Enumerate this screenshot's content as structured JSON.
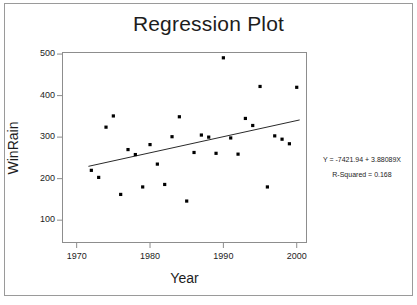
{
  "chart_data": {
    "type": "scatter",
    "title": "Regression Plot",
    "xlabel": "Year",
    "ylabel": "WinRain",
    "xlim": [
      1968.0,
      2001.4
    ],
    "ylim": [
      45,
      505
    ],
    "xticks": [
      1970,
      1980,
      1990,
      2000
    ],
    "yticks": [
      100,
      200,
      300,
      400,
      500
    ],
    "grid": false,
    "legend": null,
    "marker": "filled-square",
    "marker_color": "#000000",
    "line_color": "#2a2a2a",
    "points": [
      {
        "x": 1972,
        "y": 220
      },
      {
        "x": 1973,
        "y": 203
      },
      {
        "x": 1974,
        "y": 324
      },
      {
        "x": 1975,
        "y": 351
      },
      {
        "x": 1976,
        "y": 162
      },
      {
        "x": 1977,
        "y": 270
      },
      {
        "x": 1978,
        "y": 258
      },
      {
        "x": 1979,
        "y": 180
      },
      {
        "x": 1980,
        "y": 282
      },
      {
        "x": 1981,
        "y": 235
      },
      {
        "x": 1982,
        "y": 186
      },
      {
        "x": 1983,
        "y": 301
      },
      {
        "x": 1984,
        "y": 349
      },
      {
        "x": 1985,
        "y": 146
      },
      {
        "x": 1986,
        "y": 263
      },
      {
        "x": 1987,
        "y": 305
      },
      {
        "x": 1988,
        "y": 300
      },
      {
        "x": 1989,
        "y": 261
      },
      {
        "x": 1990,
        "y": 491
      },
      {
        "x": 1991,
        "y": 298
      },
      {
        "x": 1992,
        "y": 259
      },
      {
        "x": 1993,
        "y": 345
      },
      {
        "x": 1994,
        "y": 328
      },
      {
        "x": 1995,
        "y": 422
      },
      {
        "x": 1996,
        "y": 180
      },
      {
        "x": 1997,
        "y": 303
      },
      {
        "x": 1998,
        "y": 295
      },
      {
        "x": 1999,
        "y": 284
      },
      {
        "x": 2000,
        "y": 420
      }
    ],
    "fit_line": {
      "equation": "Y = -7421.94 + 3.88089X",
      "intercept": -7421.94,
      "slope": 3.88089,
      "r_squared": 0.168,
      "x_start": 1971.6,
      "x_end": 2000.4
    },
    "annotations": {
      "equation_text": "Y = -7421.94 + 3.88089X",
      "r_squared_text": "R-Squared = 0.168"
    }
  },
  "axis": {
    "y_tick_labels": [
      "500",
      "400",
      "300",
      "200",
      "100"
    ],
    "x_tick_labels": [
      "1970",
      "1980",
      "1990",
      "2000"
    ]
  }
}
